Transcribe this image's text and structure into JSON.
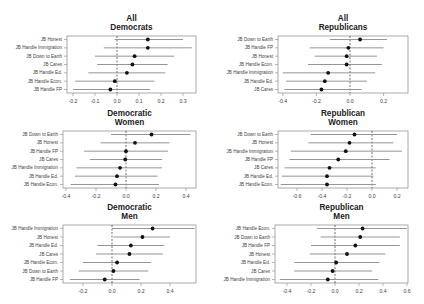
{
  "chart_data": [
    {
      "type": "dot-and-whisker",
      "title": "All Democrats",
      "title_lines": [
        "All",
        "Democrats"
      ],
      "frame": {
        "x0": 67,
        "x1": 196,
        "y0": 36,
        "y1": 93
      },
      "xaxis": {
        "ticks": [
          -0.2,
          -0.1,
          0.0,
          0.1,
          0.2,
          0.3
        ],
        "tick_labels": [
          "-0.2",
          "-0.1",
          "0.0",
          "0.1",
          "0.2",
          "0.3"
        ],
        "px_at_zero": 117,
        "px_per_unit": 220
      },
      "reference_line": 0,
      "rows": [
        {
          "label": "JB Honest",
          "estimate": 0.14,
          "lo": -0.01,
          "hi": 0.3
        },
        {
          "label": "JB Handle Immigration",
          "estimate": 0.14,
          "lo": -0.06,
          "hi": 0.34
        },
        {
          "label": "JB Down to Earth",
          "estimate": 0.08,
          "lo": -0.1,
          "hi": 0.26
        },
        {
          "label": "JB Cares",
          "estimate": 0.07,
          "lo": -0.09,
          "hi": 0.23
        },
        {
          "label": "JB Handle Ed.",
          "estimate": 0.045,
          "lo": -0.13,
          "hi": 0.22
        },
        {
          "label": "JB Handle Econ.",
          "estimate": -0.01,
          "lo": -0.19,
          "hi": 0.17
        },
        {
          "label": "JB Handle FP",
          "estimate": -0.03,
          "lo": -0.2,
          "hi": 0.15
        }
      ]
    },
    {
      "type": "dot-and-whisker",
      "title": "All Republicans",
      "title_lines": [
        "All",
        "Republicans"
      ],
      "frame": {
        "x0": 278,
        "x1": 408,
        "y0": 36,
        "y1": 93
      },
      "xaxis": {
        "ticks": [
          -0.4,
          -0.2,
          0.0,
          0.2
        ],
        "tick_labels": [
          "-0.4",
          "-0.2",
          "0.0",
          "0.2"
        ],
        "px_at_zero": 350,
        "px_per_unit": 168
      },
      "reference_line": 0,
      "rows": [
        {
          "label": "JB Down to Earth",
          "estimate": 0.06,
          "lo": -0.12,
          "hi": 0.22
        },
        {
          "label": "JB Handle FP",
          "estimate": -0.01,
          "lo": -0.24,
          "hi": 0.2
        },
        {
          "label": "JB Honest",
          "estimate": -0.02,
          "lo": -0.21,
          "hi": 0.16
        },
        {
          "label": "JB Handle Econ.",
          "estimate": -0.02,
          "lo": -0.25,
          "hi": 0.19
        },
        {
          "label": "JB Handle Immigration",
          "estimate": -0.13,
          "lo": -0.4,
          "hi": 0.15
        },
        {
          "label": "JB Handle Ed.",
          "estimate": -0.15,
          "lo": -0.38,
          "hi": 0.1
        },
        {
          "label": "JB Cares",
          "estimate": -0.17,
          "lo": -0.39,
          "hi": 0.07
        }
      ]
    },
    {
      "type": "dot-and-whisker",
      "title": "Democratic Women",
      "title_lines": [
        "Democratic",
        "Women"
      ],
      "frame": {
        "x0": 63,
        "x1": 196,
        "y0": 131,
        "y1": 188
      },
      "xaxis": {
        "ticks": [
          -0.4,
          -0.2,
          0.0,
          0.2,
          0.4
        ],
        "tick_labels": [
          "-0.4",
          "-0.2",
          "0.0",
          "0.2",
          "0.4"
        ],
        "px_at_zero": 126,
        "px_per_unit": 150
      },
      "reference_line": 0,
      "rows": [
        {
          "label": "JB Down to Earth",
          "estimate": 0.17,
          "lo": -0.1,
          "hi": 0.43
        },
        {
          "label": "JB Honest",
          "estimate": 0.06,
          "lo": -0.17,
          "hi": 0.29
        },
        {
          "label": "JB Handle FP",
          "estimate": 0.0,
          "lo": -0.28,
          "hi": 0.28
        },
        {
          "label": "JB Cares",
          "estimate": -0.005,
          "lo": -0.24,
          "hi": 0.24
        },
        {
          "label": "JB Handle Immigration",
          "estimate": -0.04,
          "lo": -0.33,
          "hi": 0.24
        },
        {
          "label": "JB Handle Ed.",
          "estimate": -0.06,
          "lo": -0.34,
          "hi": 0.21
        },
        {
          "label": "JB Handle Econ.",
          "estimate": -0.07,
          "lo": -0.37,
          "hi": 0.22
        }
      ]
    },
    {
      "type": "dot-and-whisker",
      "title": "Republican Women",
      "title_lines": [
        "Republican",
        "Women"
      ],
      "frame": {
        "x0": 278,
        "x1": 408,
        "y0": 131,
        "y1": 188
      },
      "xaxis": {
        "ticks": [
          -0.6,
          -0.4,
          -0.2,
          0.0,
          0.2
        ],
        "tick_labels": [
          "-0.6",
          "-0.4",
          "-0.2",
          "0.0",
          "0.2"
        ],
        "px_at_zero": 372,
        "px_per_unit": 125
      },
      "reference_line": 0,
      "rows": [
        {
          "label": "JB Down to Earth",
          "estimate": -0.14,
          "lo": -0.49,
          "hi": 0.2
        },
        {
          "label": "JB Honest",
          "estimate": -0.18,
          "lo": -0.51,
          "hi": 0.17
        },
        {
          "label": "JB Handle Immigration",
          "estimate": -0.21,
          "lo": -0.65,
          "hi": 0.24
        },
        {
          "label": "JB Handle FP",
          "estimate": -0.27,
          "lo": -0.66,
          "hi": 0.14
        },
        {
          "label": "JB Cares",
          "estimate": -0.34,
          "lo": -0.7,
          "hi": 0.03
        },
        {
          "label": "JB Handle Ed.",
          "estimate": -0.36,
          "lo": -0.72,
          "hi": 0.01
        },
        {
          "label": "JB Handle Econ.",
          "estimate": -0.36,
          "lo": -0.73,
          "hi": 0.03
        }
      ]
    },
    {
      "type": "dot-and-whisker",
      "title": "Democratic Men",
      "title_lines": [
        "Democratic",
        "Men"
      ],
      "frame": {
        "x0": 63,
        "x1": 196,
        "y0": 225,
        "y1": 283
      },
      "xaxis": {
        "ticks": [
          -0.2,
          0.0,
          0.2,
          0.4
        ],
        "tick_labels": [
          "-0.2",
          "0.0",
          "0.2",
          "0.4"
        ],
        "px_at_zero": 112,
        "px_per_unit": 145
      },
      "reference_line": 0,
      "rows": [
        {
          "label": "JB Handle Immigration",
          "estimate": 0.28,
          "lo": 0.0,
          "hi": 0.57
        },
        {
          "label": "JB Honest",
          "estimate": 0.21,
          "lo": 0.01,
          "hi": 0.4
        },
        {
          "label": "JB Handle Ed.",
          "estimate": 0.13,
          "lo": -0.1,
          "hi": 0.36
        },
        {
          "label": "JB Cares",
          "estimate": 0.12,
          "lo": -0.11,
          "hi": 0.35
        },
        {
          "label": "JB Handle Econ.",
          "estimate": 0.035,
          "lo": -0.2,
          "hi": 0.27
        },
        {
          "label": "JB Down to Earth",
          "estimate": 0.01,
          "lo": -0.23,
          "hi": 0.25
        },
        {
          "label": "JB Handle FP",
          "estimate": -0.05,
          "lo": -0.29,
          "hi": 0.19
        }
      ]
    },
    {
      "type": "dot-and-whisker",
      "title": "Republican Men",
      "title_lines": [
        "Republican",
        "Men"
      ],
      "frame": {
        "x0": 275,
        "x1": 408,
        "y0": 225,
        "y1": 283
      },
      "xaxis": {
        "ticks": [
          -0.4,
          -0.2,
          0.0,
          0.2,
          0.4,
          0.6
        ],
        "tick_labels": [
          "-0.4",
          "-0.2",
          "0.0",
          "0.2",
          "0.4",
          "0.6"
        ],
        "px_at_zero": 335,
        "px_per_unit": 120
      },
      "reference_line": 0,
      "rows": [
        {
          "label": "JB Handle Econ.",
          "estimate": 0.23,
          "lo": -0.15,
          "hi": 0.6
        },
        {
          "label": "JB Down to Earth",
          "estimate": 0.21,
          "lo": -0.12,
          "hi": 0.54
        },
        {
          "label": "JB Handle FP",
          "estimate": 0.17,
          "lo": -0.2,
          "hi": 0.54
        },
        {
          "label": "JB Honest",
          "estimate": 0.1,
          "lo": -0.21,
          "hi": 0.42
        },
        {
          "label": "JB Handle Ed.",
          "estimate": 0.01,
          "lo": -0.34,
          "hi": 0.37
        },
        {
          "label": "JB Cares",
          "estimate": -0.02,
          "lo": -0.34,
          "hi": 0.31
        },
        {
          "label": "JB Handle Immigration",
          "estimate": -0.06,
          "lo": -0.46,
          "hi": 0.36
        }
      ]
    }
  ],
  "colors": {
    "point": "#111111",
    "ci_line": "#8a8a8a",
    "frame": "#888888",
    "reference": "#333333",
    "text": "#444444"
  }
}
